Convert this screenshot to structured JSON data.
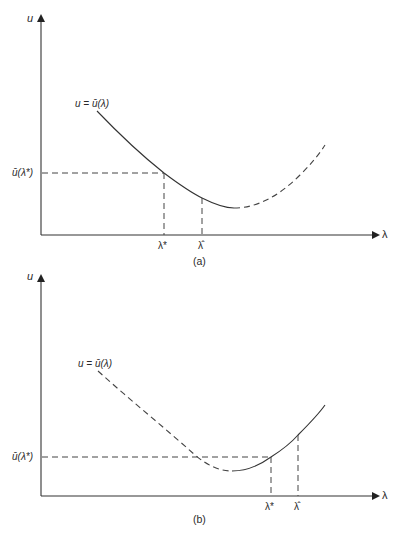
{
  "figure": {
    "panel_a": {
      "caption": "(a)",
      "y_axis_label": "u",
      "x_axis_label": "λ",
      "curve_label": "u = ū(λ)",
      "y_marker_label": "ū(λ*)",
      "x_markers": [
        {
          "label": "λ*"
        },
        {
          "label": "λ̂"
        }
      ],
      "description": "Curve solid from start, decreasing past λ* and λ̂, dashed after reaching minimum and rising"
    },
    "panel_b": {
      "caption": "(b)",
      "y_axis_label": "u",
      "x_axis_label": "λ",
      "curve_label": "u = ū(λ)",
      "y_marker_label": "ū(λ*)",
      "x_markers": [
        {
          "label": "λ*"
        },
        {
          "label": "λ̂"
        }
      ],
      "description": "Curve dashed while decreasing to minimum, solid while rising past λ* and λ̂"
    },
    "colors": {
      "line": "#3a3a3a",
      "dash": "#4a4a4a",
      "background": "#ffffff"
    }
  }
}
